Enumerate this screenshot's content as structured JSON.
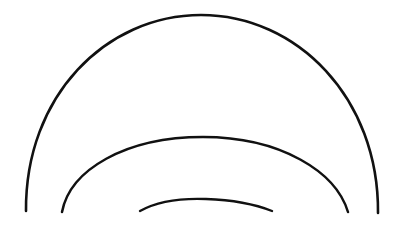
{
  "figure": {
    "background_color": "#ffffff",
    "stroke_color": "#111111",
    "width": 409,
    "height": 229
  },
  "chart_data": {
    "type": "line",
    "subtitle": "",
    "xlabel": "",
    "ylabel": "",
    "xlim": [
      0,
      409
    ],
    "ylim": [
      0,
      229
    ],
    "grid": false,
    "legend": "none",
    "annotations": [],
    "shared_center": {
      "cx": 202,
      "cy": 212
    },
    "series": [
      {
        "name": "outer-arc",
        "shape": "arc",
        "radius": 177,
        "apex": {
          "x": 200,
          "y": 15
        },
        "left_end": {
          "x": 26,
          "y": 211
        },
        "right_end": {
          "x": 378,
          "y": 213
        },
        "stroke_width": 2.6,
        "stroke": "#111111",
        "path": "M 26 211 C 25 96 106 15 201 15 C 297 15 379 98 378 213"
      },
      {
        "name": "middle-arc",
        "shape": "arc",
        "radius": 110,
        "apex": {
          "x": 202,
          "y": 137
        },
        "left_end": {
          "x": 62,
          "y": 212
        },
        "right_end": {
          "x": 348,
          "y": 212
        },
        "stroke_width": 2.5,
        "stroke": "#111111",
        "path": "M 62 212 C 70 170 125 137 203 137 C 281 137 336 172 348 212"
      },
      {
        "name": "inner-arc",
        "shape": "arc",
        "radius": 68,
        "apex": {
          "x": 205,
          "y": 199
        },
        "left_end": {
          "x": 140,
          "y": 211
        },
        "right_end": {
          "x": 272,
          "y": 211
        },
        "stroke_width": 2.4,
        "stroke": "#111111",
        "path": "M 140 211 C 156 202 180 198 206 199 C 234 200 257 205 272 211"
      }
    ]
  }
}
